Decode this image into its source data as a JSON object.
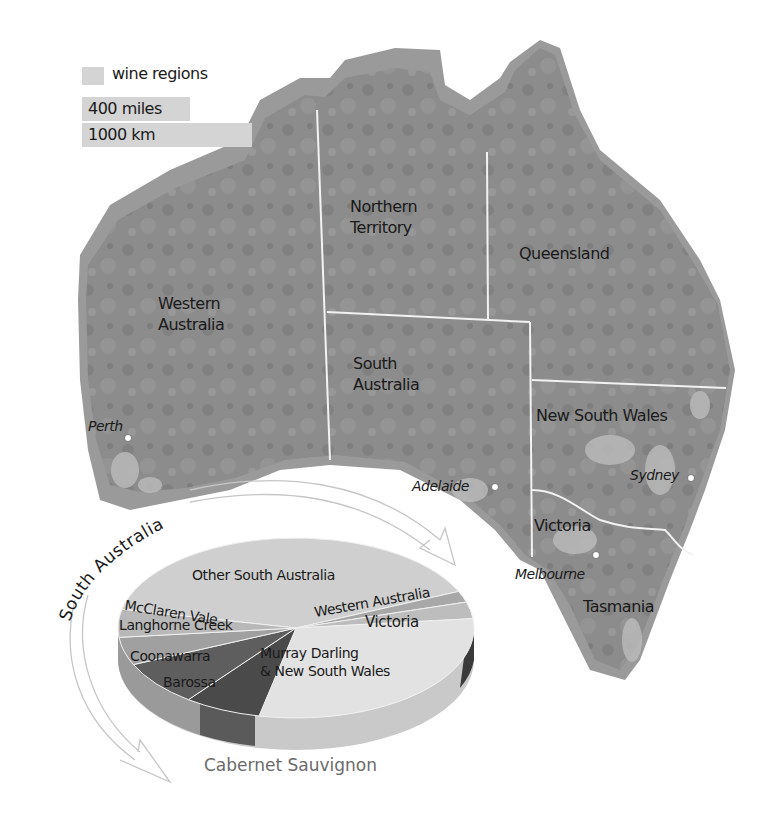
{
  "legend": {
    "wine_regions": "wine regions",
    "scale_miles": "400 miles",
    "scale_km": "1000 km",
    "colors": {
      "wine_region": "#d4d4d4"
    }
  },
  "map": {
    "states": {
      "western_australia": [
        "Western",
        "Australia"
      ],
      "northern_territory": [
        "Northern",
        "Territory"
      ],
      "queensland": "Queensland",
      "south_australia": [
        "South",
        "Australia"
      ],
      "new_south_wales": "New South Wales",
      "victoria": "Victoria",
      "tasmania": "Tasmania"
    },
    "cities": {
      "perth": "Perth",
      "adelaide": "Adelaide",
      "sydney": "Sydney",
      "melbourne": "Melbourne"
    },
    "colors": {
      "land": "#8a8a8a",
      "coast_band": "#9a9a9a",
      "border": "#f2f2f2"
    }
  },
  "arrow_label": "South Australia",
  "chart_data": {
    "type": "pie",
    "title": "Cabernet Sauvignon",
    "style": "3d",
    "group_annotation": "South Australia",
    "categories": [
      "Other South Australia",
      "Western Australia",
      "Victoria",
      "Murray Darling & New South Wales",
      "Barossa",
      "Coonawarra",
      "Langhorne Creek",
      "McClaren Vale"
    ],
    "values": [
      40,
      2,
      3,
      30,
      7,
      8,
      5,
      5
    ],
    "units": "approximate percent share (estimated from slice angles)",
    "colors": [
      "#cfcfcf",
      "#a8a8a8",
      "#bdbdbd",
      "#e2e2e2",
      "#4a4a4a",
      "#5e5e5e",
      "#a0a0a0",
      "#b8b8b8"
    ],
    "legend": "none (labels on slices)"
  },
  "pie_labels": {
    "other_sa": "Other South Australia",
    "mcclaren": "McClaren Vale",
    "langhorne": "Langhorne Creek",
    "coonawarra": "Coonawarra",
    "barossa": "Barossa",
    "western_australia": "Western Australia",
    "victoria": "Victoria",
    "murray_1": "Murray Darling",
    "murray_2": "& New South Wales"
  }
}
